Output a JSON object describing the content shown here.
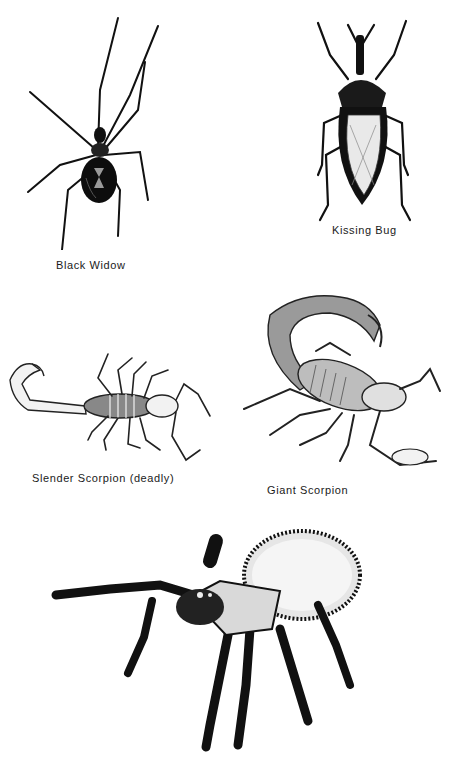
{
  "plate": {
    "specimens": [
      {
        "id": "black-widow",
        "caption": "Black Widow"
      },
      {
        "id": "kissing-bug",
        "caption": "Kissing Bug"
      },
      {
        "id": "slender-scorpion",
        "caption": "Slender Scorpion (deadly)"
      },
      {
        "id": "giant-scorpion",
        "caption": "Giant Scorpion"
      },
      {
        "id": "tarantula",
        "caption": ""
      }
    ]
  },
  "colors": {
    "ink": "#111111",
    "paper": "#ffffff",
    "shade": "#bdbdbd"
  }
}
